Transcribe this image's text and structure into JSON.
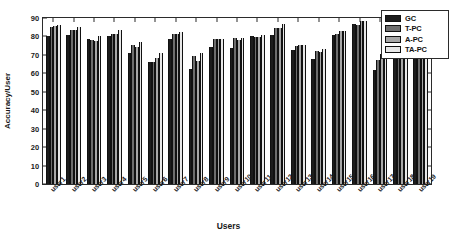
{
  "chart_data": {
    "type": "bar",
    "title": "",
    "xlabel": "Users",
    "ylabel": "Accuracy/User",
    "ylim": [
      0,
      90
    ],
    "ytick_values": [
      0,
      10,
      20,
      30,
      40,
      50,
      60,
      70,
      80,
      90
    ],
    "ytick_labels": [
      "0",
      "10",
      "20",
      "30",
      "40",
      "50",
      "60",
      "70",
      "80",
      "90"
    ],
    "grid": false,
    "legend_position": "upper right",
    "categories": [
      "user1",
      "user2",
      "user3",
      "user4",
      "user5",
      "user6",
      "user7",
      "user8",
      "user9",
      "user10",
      "user11",
      "user12",
      "user13",
      "user14",
      "user15",
      "user16",
      "user17",
      "user18",
      "user19"
    ],
    "series": [
      {
        "name": "GC",
        "color": "#1c1c1c",
        "values": [
          80.3,
          81.0,
          78.4,
          80.3,
          70.8,
          66.2,
          78.5,
          62.2,
          74.5,
          74.0,
          80.5,
          80.7,
          72.4,
          68.0,
          80.8,
          86.5,
          62.0,
          86.6,
          89.0
        ]
      },
      {
        "name": "T-PC",
        "color": "#6e6e6e",
        "values": [
          85.4,
          83.3,
          78.0,
          81.4,
          75.6,
          66.3,
          81.5,
          69.5,
          78.5,
          79.0,
          79.5,
          84.8,
          75.0,
          72.3,
          81.5,
          86.2,
          67.0,
          86.5,
          89.0
        ]
      },
      {
        "name": "A-PC",
        "color": "#a8a8a8",
        "values": [
          85.5,
          83.5,
          77.5,
          81.4,
          74.3,
          68.5,
          81.5,
          66.5,
          78.5,
          78.0,
          79.5,
          84.8,
          75.4,
          71.5,
          82.8,
          88.5,
          70.5,
          88.8,
          88.5
        ]
      },
      {
        "name": "TA-PC",
        "color": "#e8e8e8",
        "values": [
          86.1,
          85.0,
          80.0,
          83.3,
          76.8,
          70.8,
          82.5,
          71.0,
          78.5,
          79.0,
          81.0,
          86.5,
          75.5,
          73.0,
          83.2,
          88.2,
          73.5,
          88.5,
          88.3
        ]
      }
    ]
  }
}
